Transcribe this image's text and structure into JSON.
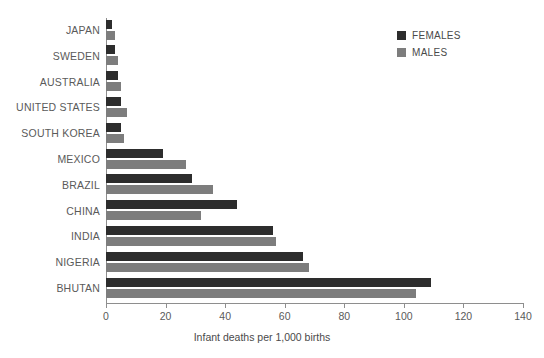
{
  "chart_data": {
    "type": "bar",
    "orientation": "horizontal",
    "title": "",
    "xlabel": "Infant deaths per 1,000 births",
    "ylabel": "",
    "xlim": [
      0,
      140
    ],
    "xticks": [
      0,
      20,
      40,
      60,
      80,
      100,
      120,
      140
    ],
    "xtick_labels": [
      "0",
      "20",
      "40",
      "60",
      "80",
      "100",
      "120",
      "140"
    ],
    "grid": false,
    "legend_position": "top-right",
    "categories": [
      "JAPAN",
      "SWEDEN",
      "AUSTRALIA",
      "UNITED STATES",
      "SOUTH KOREA",
      "MEXICO",
      "BRAZIL",
      "CHINA",
      "INDIA",
      "NIGERIA",
      "BHUTAN"
    ],
    "series": [
      {
        "name": "FEMALES",
        "color": "#2d2d2d",
        "values": [
          2,
          3,
          4,
          5,
          5,
          19,
          29,
          44,
          56,
          66,
          109
        ]
      },
      {
        "name": "MALES",
        "color": "#7d7d7d",
        "values": [
          3,
          4,
          5,
          7,
          6,
          27,
          36,
          32,
          57,
          68,
          104
        ]
      }
    ]
  },
  "legend": {
    "items": [
      {
        "label": "FEMALES",
        "color": "#2d2d2d",
        "swatch_name": "legend-swatch-females"
      },
      {
        "label": "MALES",
        "color": "#7d7d7d",
        "swatch_name": "legend-swatch-males"
      }
    ]
  },
  "axis": {
    "title": "Infant deaths per 1,000 births"
  },
  "colors": {
    "females": "#2d2d2d",
    "males": "#7d7d7d",
    "axis": "#8e8e8e",
    "text": "#4a4a4a",
    "background": "#ffffff"
  }
}
